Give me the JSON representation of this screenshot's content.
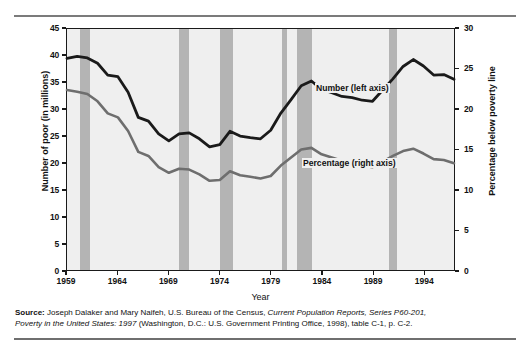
{
  "figure": {
    "x_axis_title": "Year",
    "y_left_title": "Number of poor (in millions)",
    "y_right_title": "Percentage below poverty line",
    "series_labels": {
      "number": "Number (left axis)",
      "percentage": "Percentage (right axis)"
    },
    "colors": {
      "number_line": "#1a1a1a",
      "percentage_line": "#6e6e6e",
      "recession_band": "#b4b4b4",
      "plot_background": "#efefef",
      "rule": "#7b7b7b"
    }
  },
  "source": {
    "label": "Source:",
    "text_1": " Joseph Dalaker and Mary Naifeh, U.S. Bureau of the Census, ",
    "italic_1": "Current Population Reports, Series P60-201,",
    "italic_2": "Poverty in the United States: 1997",
    "text_2": " (Washington, D.C.: U.S. Government Printing Office, 1998), table C-1, p. C-2."
  },
  "chart_data": {
    "type": "line",
    "title": "",
    "subtitle": "",
    "xlabel": "Year",
    "ylabel": "Number of poor (in millions)",
    "y2label": "Percentage below poverty line",
    "xlim": [
      1959,
      1997
    ],
    "ylim": [
      0,
      45
    ],
    "y2lim": [
      0,
      30
    ],
    "yticks": [
      0,
      5,
      10,
      15,
      20,
      25,
      30,
      35,
      40,
      45
    ],
    "y2ticks": [
      0,
      5,
      10,
      15,
      20,
      25,
      30
    ],
    "xticks": [
      1959,
      1964,
      1969,
      1974,
      1979,
      1984,
      1989,
      1994
    ],
    "grid": false,
    "legend_position": "inline-annotation",
    "x": [
      1959,
      1960,
      1961,
      1962,
      1963,
      1964,
      1965,
      1966,
      1967,
      1968,
      1969,
      1970,
      1971,
      1972,
      1973,
      1974,
      1975,
      1976,
      1977,
      1978,
      1979,
      1980,
      1981,
      1982,
      1983,
      1984,
      1985,
      1986,
      1987,
      1988,
      1989,
      1990,
      1991,
      1992,
      1993,
      1994,
      1995,
      1996,
      1997
    ],
    "series": [
      {
        "name": "Number (left axis)",
        "axis": "left",
        "units": "millions",
        "color": "#1a1a1a",
        "values": [
          39.5,
          39.9,
          39.6,
          38.6,
          36.4,
          36.1,
          33.2,
          28.5,
          27.8,
          25.4,
          24.1,
          25.4,
          25.6,
          24.5,
          23.0,
          23.4,
          25.9,
          25.0,
          24.7,
          24.5,
          26.1,
          29.3,
          31.8,
          34.4,
          35.3,
          33.7,
          33.1,
          32.4,
          32.2,
          31.7,
          31.5,
          33.6,
          35.7,
          38.0,
          39.3,
          38.1,
          36.4,
          36.5,
          35.6
        ]
      },
      {
        "name": "Percentage (right axis)",
        "axis": "right",
        "units": "percent",
        "color": "#6e6e6e",
        "values": [
          22.4,
          22.2,
          21.9,
          21.0,
          19.5,
          19.0,
          17.3,
          14.7,
          14.2,
          12.8,
          12.1,
          12.6,
          12.5,
          11.9,
          11.1,
          11.2,
          12.3,
          11.8,
          11.6,
          11.4,
          11.7,
          13.0,
          14.0,
          15.0,
          15.2,
          14.4,
          14.0,
          13.6,
          13.4,
          13.0,
          12.8,
          13.5,
          14.2,
          14.8,
          15.1,
          14.5,
          13.8,
          13.7,
          13.3
        ]
      }
    ],
    "recession_bands": [
      {
        "start": 1960.3,
        "end": 1961.2
      },
      {
        "start": 1969.9,
        "end": 1970.9
      },
      {
        "start": 1973.9,
        "end": 1975.2
      },
      {
        "start": 1980.0,
        "end": 1980.5
      },
      {
        "start": 1981.5,
        "end": 1982.9
      },
      {
        "start": 1990.5,
        "end": 1991.2
      }
    ],
    "annotations": [
      {
        "text": "Number (left axis)",
        "series": "Number (left axis)"
      },
      {
        "text": "Percentage (right axis)",
        "series": "Percentage (right axis)"
      }
    ]
  }
}
